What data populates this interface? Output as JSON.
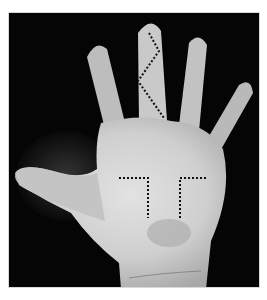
{
  "image": {
    "description": "Grayscale photograph of an open palm with fingers spread, annotated with dotted lines",
    "annotations": [
      {
        "type": "zigzag-dotted-line",
        "location": "middle finger"
      },
      {
        "type": "corner-dotted-line-left",
        "location": "palm center-left"
      },
      {
        "type": "corner-dotted-line-right",
        "location": "palm center-right"
      }
    ],
    "colors": {
      "background": "#050505",
      "skin_light": "#d9d9d9",
      "skin_mid": "#b5b5b5",
      "skin_shadow": "#6e6e6e",
      "annotation": "#111111",
      "page": "#ffffff"
    }
  }
}
